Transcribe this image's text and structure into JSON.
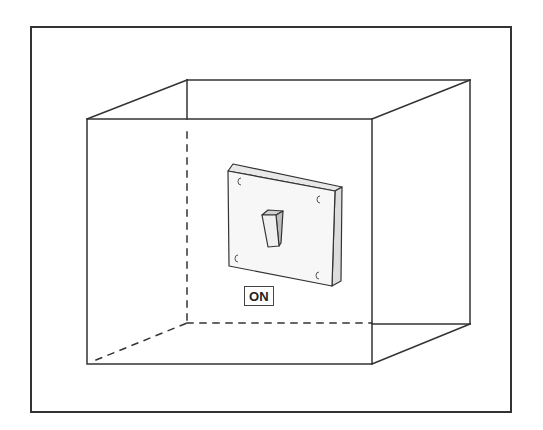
{
  "diagram": {
    "switch_state_label": "ON",
    "colors": {
      "line": "#333333",
      "background": "#ffffff",
      "plate_shade": "#f2f2f2",
      "plate_side": "#e4e4e4"
    },
    "elements": [
      {
        "name": "outer-frame",
        "type": "rectangle"
      },
      {
        "name": "room-cube",
        "type": "wireframe-cube",
        "hidden_edges": "dashed"
      },
      {
        "name": "wall-switch",
        "type": "toggle-switch-plate",
        "state": "ON"
      },
      {
        "name": "state-label",
        "type": "text-box",
        "text": "ON"
      }
    ]
  }
}
